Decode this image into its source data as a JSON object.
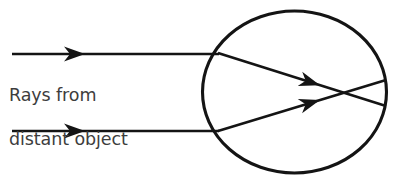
{
  "figure": {
    "caption_lines": [
      "Rays from",
      "distant object"
    ],
    "caption_full": "Rays from distant object",
    "caption_color": "#3d3d3d",
    "line_color": "#141414",
    "background_color": "#ffffff"
  },
  "chart_data": {
    "type": "diagram",
    "title": "Rays from distant object",
    "canvas": {
      "width": 400,
      "height": 183
    },
    "eye": {
      "label": "eyeball",
      "shape": "ellipse",
      "cx": 294.5,
      "cy": 92,
      "rx": 92,
      "ry": 81,
      "stroke_width": 3.1
    },
    "incoming_rays": [
      {
        "name": "upper-incoming-ray",
        "x1": 12,
        "y1": 54,
        "x2": 219,
        "y2": 54,
        "arrow_tip_x": 85,
        "arrow_tip_y": 54,
        "arrow_angle_deg": 0
      },
      {
        "name": "lower-incoming-ray",
        "x1": 12,
        "y1": 131,
        "x2": 219,
        "y2": 131,
        "arrow_tip_x": 85,
        "arrow_tip_y": 131,
        "arrow_angle_deg": 0
      }
    ],
    "refracted_rays": [
      {
        "name": "upper-refracted-ray",
        "x1": 218,
        "y1": 53,
        "x2": 386,
        "y2": 106,
        "arrow_tip_x": 320,
        "arrow_tip_y": 85.2,
        "arrow_angle_deg": 17.5
      },
      {
        "name": "lower-refracted-ray",
        "x1": 218,
        "y1": 131,
        "x2": 386,
        "y2": 80,
        "arrow_tip_x": 320,
        "arrow_tip_y": 100,
        "arrow_angle_deg": -16.9
      }
    ],
    "focus_point": {
      "x": 346,
      "y": 93,
      "label": "rays cross (focal point)"
    },
    "entry_points": [
      {
        "x": 218,
        "y": 53,
        "label": "upper ray entry"
      },
      {
        "x": 218,
        "y": 131,
        "label": "lower ray entry"
      }
    ],
    "axis_ranges": {
      "x": [
        0,
        400
      ],
      "y": [
        0,
        183
      ]
    },
    "grid": false,
    "legend": "none"
  }
}
